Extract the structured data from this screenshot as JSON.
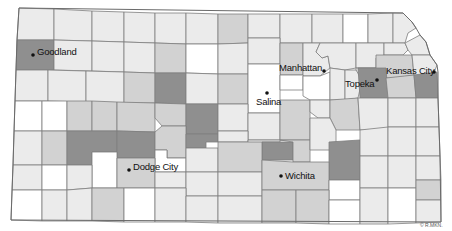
{
  "map": {
    "title": "Kansas counties",
    "colors": {
      "white": "#ffffff",
      "light": "#ebebeb",
      "mid": "#d2d2d2",
      "dark": "#8f8f8f",
      "border": "#7d7d7d"
    },
    "cities": [
      {
        "name": "Goodland",
        "dot": [
          33,
          55
        ],
        "label": [
          37,
          47
        ]
      },
      {
        "name": "Manhattan",
        "dot": [
          324,
          71
        ],
        "label": [
          279,
          63
        ]
      },
      {
        "name": "Kansas City",
        "dot": [
          434,
          72
        ],
        "label": [
          386,
          66
        ]
      },
      {
        "name": "Topeka",
        "dot": [
          377,
          80
        ],
        "label": [
          345,
          79
        ]
      },
      {
        "name": "Salina",
        "dot": [
          267,
          93
        ],
        "label": [
          256,
          97
        ]
      },
      {
        "name": "Dodge City",
        "dot": [
          129,
          170
        ],
        "label": [
          133,
          162
        ]
      },
      {
        "name": "Wichita",
        "dot": [
          281,
          176
        ],
        "label": [
          285,
          171
        ]
      }
    ],
    "credit": "© R.MKN.",
    "counties": [
      {
        "pts": "19,8 54,9 54,40 17,40",
        "shade": "light"
      },
      {
        "pts": "54,9 92,11 92,41 54,40",
        "shade": "light"
      },
      {
        "pts": "92,11 124,12 124,42 92,41",
        "shade": "light"
      },
      {
        "pts": "124,12 155,13 155,43 124,42",
        "shade": "light"
      },
      {
        "pts": "155,13 186,13 186,44 155,43",
        "shade": "light"
      },
      {
        "pts": "186,13 218,14 218,44 186,44",
        "shade": "light"
      },
      {
        "pts": "218,14 248,14 248,43 218,44",
        "shade": "mid"
      },
      {
        "pts": "248,14 280,14 280,38 248,38",
        "shade": "light"
      },
      {
        "pts": "280,14 312,14 312,43 280,43",
        "shade": "light"
      },
      {
        "pts": "312,14 343,14 343,43 312,43",
        "shade": "light"
      },
      {
        "pts": "343,14 368,14 368,43 343,43",
        "shade": "white"
      },
      {
        "pts": "368,14 393,13 393,43 368,43",
        "shade": "light"
      },
      {
        "pts": "393,13 403,13 412,22 416,28 408,33 405,43 393,43",
        "shade": "light"
      },
      {
        "pts": "17,40 54,40 54,70 16,70",
        "shade": "dark"
      },
      {
        "pts": "54,40 92,41 92,71 54,70",
        "shade": "light"
      },
      {
        "pts": "92,41 124,42 124,72 92,71",
        "shade": "light"
      },
      {
        "pts": "124,42 155,43 155,73 124,72",
        "shade": "light"
      },
      {
        "pts": "155,43 186,44 186,73 155,73",
        "shade": "mid"
      },
      {
        "pts": "186,44 218,44 218,74 186,73",
        "shade": "white"
      },
      {
        "pts": "218,44 248,43 248,74 218,74",
        "shade": "light"
      },
      {
        "pts": "248,38 280,38 280,64 248,64",
        "shade": "light"
      },
      {
        "pts": "280,43 303,43 303,75 280,75",
        "shade": "mid"
      },
      {
        "pts": "303,43 320,43 316,52 322,58 328,56 330,68 320,76 303,76",
        "shade": "light"
      },
      {
        "pts": "320,43 356,43 356,68 345,70 330,68 328,56 322,58 316,52",
        "shade": "light"
      },
      {
        "pts": "356,43 384,43 384,55 376,58 376,68 356,68",
        "shade": "light"
      },
      {
        "pts": "384,43 405,43 408,50 403,55 384,55",
        "shade": "light"
      },
      {
        "pts": "405,43 420,35 426,42 430,55 412,55 408,50",
        "shade": "light"
      },
      {
        "pts": "376,55 412,55 414,75 396,78 376,78",
        "shade": "mid"
      },
      {
        "pts": "412,55 430,55 437,65 432,78 414,75",
        "shade": "light"
      },
      {
        "pts": "16,70 48,70 48,101 15,101",
        "shade": "light"
      },
      {
        "pts": "48,70 86,71 86,102 48,101",
        "shade": "light"
      },
      {
        "pts": "86,71 124,72 124,103 86,102",
        "shade": "light"
      },
      {
        "pts": "124,72 155,73 155,103 124,103",
        "shade": "mid"
      },
      {
        "pts": "155,73 186,73 186,104 155,103",
        "shade": "dark"
      },
      {
        "pts": "186,73 218,74 218,104 186,104",
        "shade": "light"
      },
      {
        "pts": "218,74 248,74 248,104 218,104",
        "shade": "mid"
      },
      {
        "pts": "248,64 280,64 280,113 248,113",
        "shade": "white"
      },
      {
        "pts": "280,75 303,75 303,90 280,90",
        "shade": "white"
      },
      {
        "pts": "303,76 320,76 330,72 330,100 310,100 303,96",
        "shade": "white"
      },
      {
        "pts": "330,68 345,70 345,100 330,100",
        "shade": "light"
      },
      {
        "pts": "356,68 376,68 376,78 362,80 356,74",
        "shade": "light"
      },
      {
        "pts": "345,70 356,70 362,80 358,98 345,100",
        "shade": "light"
      },
      {
        "pts": "358,68 386,68 388,98 360,98",
        "shade": "dark"
      },
      {
        "pts": "386,78 414,75 416,98 388,98",
        "shade": "mid"
      },
      {
        "pts": "414,75 437,72 438,98 416,98",
        "shade": "dark"
      },
      {
        "pts": "15,101 42,101 42,131 14,131",
        "shade": "white"
      },
      {
        "pts": "42,101 67,101 67,131 42,131",
        "shade": "white"
      },
      {
        "pts": "67,101 92,101 92,131 67,131",
        "shade": "mid"
      },
      {
        "pts": "92,101 117,102 117,131 92,131",
        "shade": "mid"
      },
      {
        "pts": "117,102 155,103 155,132 117,131",
        "shade": "mid"
      },
      {
        "pts": "155,103 186,104 186,126 162,126 155,118",
        "shade": "mid"
      },
      {
        "pts": "186,104 218,104 218,134 186,134",
        "shade": "dark"
      },
      {
        "pts": "218,104 248,104 248,131 218,131",
        "shade": "light"
      },
      {
        "pts": "248,113 280,113 280,140 248,140",
        "shade": "light"
      },
      {
        "pts": "280,100 310,100 310,140 280,140",
        "shade": "mid"
      },
      {
        "pts": "310,100 330,100 330,118 318,118 310,112",
        "shade": "light"
      },
      {
        "pts": "330,100 358,98 360,130 336,130 330,118",
        "shade": "mid"
      },
      {
        "pts": "358,98 388,98 388,130 360,130",
        "shade": "light"
      },
      {
        "pts": "388,98 416,98 416,127 388,127",
        "shade": "light"
      },
      {
        "pts": "416,98 438,98 439,127 416,127",
        "shade": "light"
      },
      {
        "pts": "14,131 42,131 42,165 13,165",
        "shade": "light"
      },
      {
        "pts": "42,131 67,131 67,165 42,165",
        "shade": "mid"
      },
      {
        "pts": "67,131 117,131 117,152 92,152 92,165 67,165",
        "shade": "dark"
      },
      {
        "pts": "117,131 155,132 155,158 117,158",
        "shade": "dark"
      },
      {
        "pts": "92,152 117,152 117,188 92,188",
        "shade": "white"
      },
      {
        "pts": "155,132 162,126 186,126 186,158 167,158 167,150 155,150",
        "shade": "mid"
      },
      {
        "pts": "155,150 167,150 167,158 186,158 186,172 155,172",
        "shade": "white"
      },
      {
        "pts": "186,134 218,134 218,142 206,142 206,148 186,148",
        "shade": "dark"
      },
      {
        "pts": "218,131 248,131 248,142 218,142",
        "shade": "light"
      },
      {
        "pts": "248,140 280,140 280,142 262,142 262,155 248,155",
        "shade": "light"
      },
      {
        "pts": "262,142 293,142 293,160 262,160",
        "shade": "dark"
      },
      {
        "pts": "280,140 310,140 310,162 293,162 293,142",
        "shade": "mid"
      },
      {
        "pts": "310,118 318,118 330,118 336,130 336,150 310,150",
        "shade": "light"
      },
      {
        "pts": "329,142 360,140 360,180 329,180",
        "shade": "dark"
      },
      {
        "pts": "360,130 388,127 388,156 360,156",
        "shade": "light"
      },
      {
        "pts": "388,127 416,127 416,156 388,156",
        "shade": "light"
      },
      {
        "pts": "416,127 439,127 440,156 416,156",
        "shade": "light"
      },
      {
        "pts": "13,165 42,165 42,190 12,190",
        "shade": "light"
      },
      {
        "pts": "42,165 67,165 67,190 42,190",
        "shade": "white"
      },
      {
        "pts": "67,165 92,165 92,188 67,190",
        "shade": "light"
      },
      {
        "pts": "117,158 155,158 155,188 117,188",
        "shade": "mid"
      },
      {
        "pts": "155,172 186,172 186,188 155,188",
        "shade": "light"
      },
      {
        "pts": "186,148 218,148 218,172 186,172",
        "shade": "light"
      },
      {
        "pts": "218,142 262,142 262,172 218,172",
        "shade": "mid"
      },
      {
        "pts": "186,172 218,172 218,196 186,196",
        "shade": "light"
      },
      {
        "pts": "218,172 262,172 262,196 218,196",
        "shade": "light"
      },
      {
        "pts": "262,160 293,162 329,162 329,190 262,190",
        "shade": "mid"
      },
      {
        "pts": "329,180 360,180 360,200 329,200",
        "shade": "white"
      },
      {
        "pts": "360,156 388,156 388,188 360,188",
        "shade": "light"
      },
      {
        "pts": "388,156 416,156 416,188 388,188",
        "shade": "light"
      },
      {
        "pts": "416,156 440,156 441,180 416,180",
        "shade": "light"
      },
      {
        "pts": "12,190 42,190 42,221 11,220",
        "shade": "white"
      },
      {
        "pts": "42,190 67,190 67,221 42,221",
        "shade": "light"
      },
      {
        "pts": "67,190 92,188 92,221 67,221",
        "shade": "light"
      },
      {
        "pts": "92,188 124,188 124,222 92,221",
        "shade": "mid"
      },
      {
        "pts": "124,188 155,188 155,222 124,222",
        "shade": "white"
      },
      {
        "pts": "155,188 186,188 186,222 155,222",
        "shade": "light"
      },
      {
        "pts": "186,196 218,196 218,223 186,222",
        "shade": "light"
      },
      {
        "pts": "218,196 262,196 262,223 218,223",
        "shade": "light"
      },
      {
        "pts": "262,190 296,190 296,223 262,223",
        "shade": "mid"
      },
      {
        "pts": "296,190 329,190 329,224 296,223",
        "shade": "mid"
      },
      {
        "pts": "329,200 360,200 360,224 329,224",
        "shade": "white"
      },
      {
        "pts": "360,188 388,188 388,224 360,224",
        "shade": "light"
      },
      {
        "pts": "388,188 416,188 416,223 388,224",
        "shade": "white"
      },
      {
        "pts": "416,180 441,180 441,200 416,200",
        "shade": "mid"
      },
      {
        "pts": "416,200 441,200 441,222 416,223",
        "shade": "light"
      }
    ]
  }
}
